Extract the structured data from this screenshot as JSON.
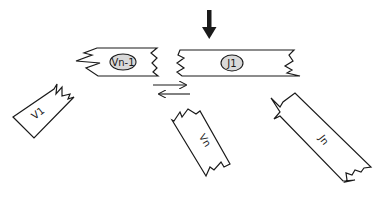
{
  "diagram": {
    "pressure_arrow": {
      "direction": "down"
    },
    "segments": [
      {
        "id": "vn-1",
        "label": "Vn-1",
        "has_oval": true
      },
      {
        "id": "j1",
        "label": "J1",
        "has_oval": true
      },
      {
        "id": "v1",
        "label": "V1",
        "has_oval": false
      },
      {
        "id": "vn",
        "label": "Vn",
        "has_oval": false
      },
      {
        "id": "jn",
        "label": "Jn",
        "has_oval": false
      }
    ],
    "exchange_arrows": [
      {
        "direction": "right"
      },
      {
        "direction": "left"
      }
    ],
    "colors": {
      "stroke": "#1a1a1a",
      "oval_fill": "#d9d9d9",
      "background": "#ffffff"
    }
  }
}
